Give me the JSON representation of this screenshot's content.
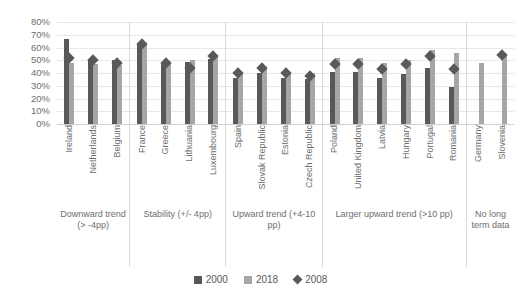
{
  "chart_data": {
    "type": "bar",
    "title": "",
    "subtitle": "",
    "xlabel": "",
    "ylabel": "",
    "ylim": [
      0,
      80
    ],
    "ytick_labels": [
      "80%",
      "70%",
      "60%",
      "50%",
      "40%",
      "30%",
      "20%",
      "10%",
      "0%"
    ],
    "ytick_values": [
      80,
      70,
      60,
      50,
      40,
      30,
      20,
      10,
      0
    ],
    "grid": true,
    "legend_position": "bottom",
    "categories": [
      "Ireland",
      "Netherlands",
      "Belgium",
      "France",
      "Greece",
      "Lithuania",
      "Luxembourg",
      "Spain",
      "Slovak Republic",
      "Estonia",
      "Czech Republic",
      "Poland",
      "United Kingdom",
      "Latvia",
      "Hungary",
      "Portugal",
      "Romania",
      "Germany",
      "Slovenia"
    ],
    "series": [
      {
        "name": "2000",
        "type": "bar",
        "color": "#595959",
        "values": [
          67,
          51,
          50,
          62,
          47,
          49,
          51,
          36,
          40,
          36,
          35,
          41,
          41,
          36,
          39,
          44,
          29,
          null,
          null
        ]
      },
      {
        "name": "2018",
        "type": "bar",
        "color": "#a6a6a6",
        "values": [
          48,
          47,
          46,
          62,
          47,
          50,
          54,
          40,
          45,
          41,
          40,
          52,
          52,
          48,
          50,
          58,
          56,
          48,
          53
        ]
      },
      {
        "name": "2008",
        "type": "marker-diamond",
        "color": "#595959",
        "values": [
          52,
          50,
          48,
          63,
          48,
          44,
          53,
          40,
          44,
          40,
          38,
          47,
          47,
          43,
          47,
          53,
          43,
          null,
          54
        ]
      }
    ],
    "groups": [
      {
        "label": "Downward trend (> -4pp)",
        "count": 3
      },
      {
        "label": "Stability (+/- 4pp)",
        "count": 4
      },
      {
        "label": "Upward trend (+4-10 pp)",
        "count": 4
      },
      {
        "label": "Larger upward trend (>10 pp)",
        "count": 6
      },
      {
        "label": "No long term data",
        "count": 2
      }
    ]
  },
  "legend": {
    "items": [
      {
        "label": "2000",
        "marker": "square-dark"
      },
      {
        "label": "2018",
        "marker": "square-light"
      },
      {
        "label": "2008",
        "marker": "diamond-dark"
      }
    ]
  }
}
